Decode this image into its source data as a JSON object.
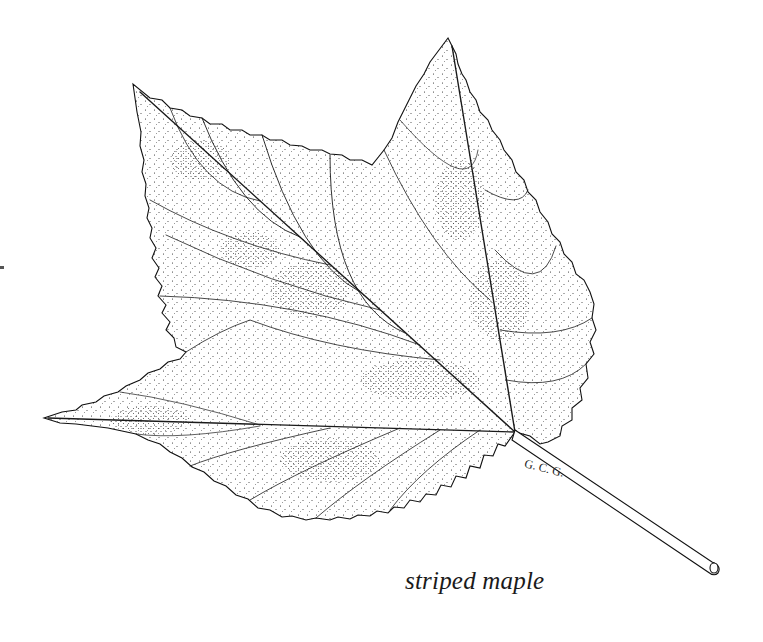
{
  "illustration": {
    "subject": "leaf",
    "style": "pen-and-ink stipple drawing",
    "colors": {
      "ink": "#1a1a1a",
      "background": "#ffffff"
    },
    "caption": "striped maple",
    "signature": "G. C. G."
  }
}
